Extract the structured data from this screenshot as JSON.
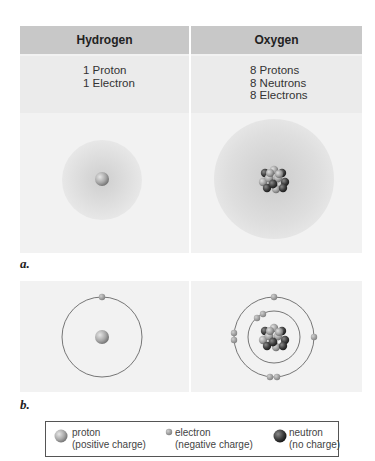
{
  "panel_a": {
    "label": "a.",
    "columns": [
      {
        "element": "Hydrogen",
        "lines": [
          "1 Proton",
          "1 Electron"
        ]
      },
      {
        "element": "Oxygen",
        "lines": [
          "8 Protons",
          "8 Neutrons",
          "8 Electrons"
        ]
      }
    ]
  },
  "panel_b": {
    "label": "b."
  },
  "legend": {
    "items": [
      {
        "icon": "proton-icon",
        "name": "proton",
        "desc": "(positive charge)"
      },
      {
        "icon": "electron-icon",
        "name": "electron",
        "desc": "(negative charge)"
      },
      {
        "icon": "neutron-icon",
        "name": "neutron",
        "desc": "(no charge)"
      }
    ]
  },
  "colors": {
    "header_bg": "#c8c8c8",
    "panel_bg": "#f2f2f2",
    "proton": "#a9a9a9",
    "neutron": "#3a3a3a",
    "electron": "#9a9a9a"
  }
}
